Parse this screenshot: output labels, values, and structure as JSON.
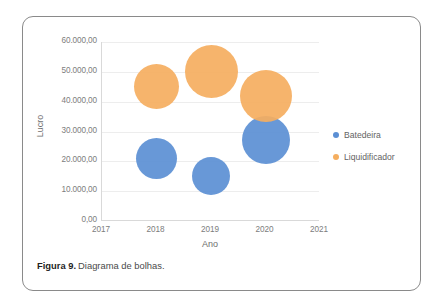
{
  "figure": {
    "caption_label": "Figura 9.",
    "caption_text": "Diagrama de bolhas."
  },
  "legend": {
    "position": "right",
    "items": [
      {
        "label": "Batedeira",
        "color": "#5b8fd4"
      },
      {
        "label": "Liquidificador",
        "color": "#f5ae5f"
      }
    ]
  },
  "chart_data": {
    "type": "scatter",
    "subtype": "bubble",
    "title": "",
    "xlabel": "Ano",
    "ylabel": "Lucro",
    "xlim": [
      2017,
      2021
    ],
    "ylim": [
      0,
      60000
    ],
    "grid": true,
    "legend_position": "right",
    "xticks": [
      "2017",
      "2018",
      "2019",
      "2020",
      "2021"
    ],
    "xtick_values": [
      2017,
      2018,
      2019,
      2020,
      2021
    ],
    "yticks": [
      "0,00",
      "10.000,00",
      "20.000,00",
      "30.000,00",
      "40.000,00",
      "50.000,00",
      "60.000,00"
    ],
    "ytick_values": [
      0,
      10000,
      20000,
      30000,
      40000,
      50000,
      60000
    ],
    "series": [
      {
        "name": "Batedeira",
        "color": "#5b8fd4",
        "points": [
          {
            "x": 2018,
            "y": 21000,
            "size": 41
          },
          {
            "x": 2019,
            "y": 15000,
            "size": 38
          },
          {
            "x": 2020,
            "y": 27000,
            "size": 48
          }
        ]
      },
      {
        "name": "Liquidificador",
        "color": "#f5ae5f",
        "points": [
          {
            "x": 2018,
            "y": 45000,
            "size": 45
          },
          {
            "x": 2019,
            "y": 50000,
            "size": 53
          },
          {
            "x": 2020,
            "y": 42000,
            "size": 52
          }
        ]
      }
    ]
  }
}
